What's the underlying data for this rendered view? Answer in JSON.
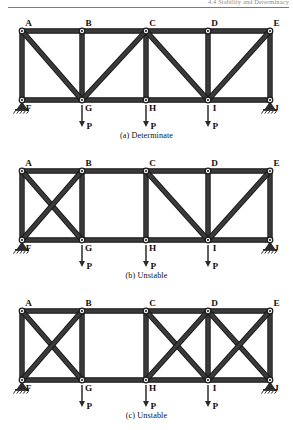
{
  "header": {
    "running_head": "4.4  Stability and Determinacy"
  },
  "figure": {
    "node_labels_top": [
      "A",
      "B",
      "C",
      "D",
      "E"
    ],
    "node_labels_bottom": [
      "F",
      "G",
      "H",
      "I",
      "J"
    ],
    "load_label": "P",
    "load_count": 3,
    "colors": {
      "member": "#3a3a3a",
      "member_edge": "#111111",
      "node_fill": "#f2f2f2",
      "node_ring": "#1a1a1a",
      "support": "#2b2b2b",
      "arrow": "#2b2b2b",
      "text": "#111111",
      "header_text": "#8c8c8c",
      "rule": "#7a7a7a"
    },
    "geometry": {
      "top_x": [
        22,
        82,
        146,
        208,
        270
      ],
      "bottom_x": [
        22,
        82,
        146,
        208,
        270
      ],
      "top_y": 22,
      "bottom_y": 91
    },
    "supports": {
      "left": {
        "node": "F",
        "type": "pin-support"
      },
      "right": {
        "node": "J",
        "type": "pin-support"
      }
    }
  },
  "diagrams": [
    {
      "id": "a",
      "caption": "(a) Determinate",
      "verdict": "Determinate",
      "diagonals": [
        {
          "from": "A",
          "to": "G"
        },
        {
          "from": "C",
          "to": "G"
        },
        {
          "from": "C",
          "to": "I"
        },
        {
          "from": "E",
          "to": "I"
        }
      ],
      "panel_bracing": [
        "single",
        "single",
        "single",
        "single"
      ]
    },
    {
      "id": "b",
      "caption": "(b) Unstable",
      "verdict": "Unstable",
      "diagonals": [
        {
          "from": "A",
          "to": "G"
        },
        {
          "from": "B",
          "to": "F"
        },
        {
          "from": "C",
          "to": "I"
        },
        {
          "from": "E",
          "to": "I"
        }
      ],
      "panel_bracing": [
        "cross",
        "none",
        "single",
        "single"
      ]
    },
    {
      "id": "c",
      "caption": "(c) Unstable",
      "verdict": "Unstable",
      "diagonals": [
        {
          "from": "A",
          "to": "G"
        },
        {
          "from": "B",
          "to": "F"
        },
        {
          "from": "C",
          "to": "I"
        },
        {
          "from": "D",
          "to": "H"
        },
        {
          "from": "D",
          "to": "J"
        },
        {
          "from": "E",
          "to": "I"
        }
      ],
      "panel_bracing": [
        "cross",
        "none",
        "cross",
        "cross"
      ]
    }
  ]
}
